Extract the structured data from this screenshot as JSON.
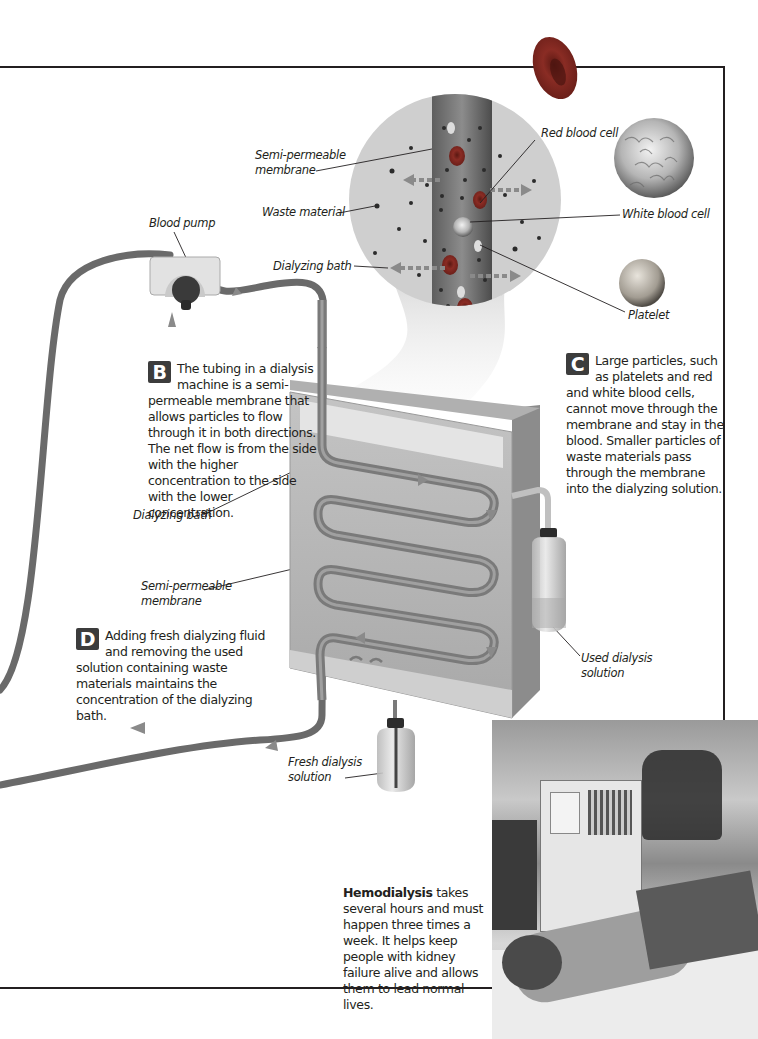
{
  "figure": {
    "callouts": {
      "b": {
        "letter": "B",
        "text": "The tubing in a dialysis machine is a semi-permeable membrane that allows particles to flow through it in both directions. The net flow is from the side with the higher concentration to the side with the lower concentration."
      },
      "c": {
        "letter": "C",
        "text": "Large particles, such as platelets and red and white blood cells, cannot move through the membrane and stay in the blood. Smaller particles of waste materials pass through the membrane into the dialyzing solution."
      },
      "d": {
        "letter": "D",
        "text": "Adding fresh dialyzing fluid and removing the used solution containing waste materials maintains the concentration of the dialyzing bath."
      }
    },
    "labels": {
      "semi_permeable_top_1": "Semi-permeable",
      "semi_permeable_top_2": "membrane",
      "waste_material": "Waste material",
      "dialyzing_bath_top": "Dialyzing bath",
      "blood_pump": "Blood pump",
      "red_blood_cell": "Red blood cell",
      "white_blood_cell": "White blood cell",
      "platelet": "Platelet",
      "dialyzing_bath_left": "Dialyzing bath",
      "semi_permeable_left_1": "Semi-permeable",
      "semi_permeable_left_2": "membrane",
      "used_solution_1": "Used dialysis",
      "used_solution_2": "solution",
      "fresh_solution_1": "Fresh dialysis",
      "fresh_solution_2": "solution"
    },
    "caption": {
      "bold": "Hemodialysis",
      "text": " takes several hours and must happen three times a week. It helps keep people with kidney failure alive and allows them to lead normal lives."
    },
    "photo": {
      "alt": "Patient receiving hemodialysis in a clinic"
    },
    "colors": {
      "rule": "#231f20",
      "badge": "#3c3c3c",
      "bath": "#b4b4b4",
      "tube": "#6e6e6e",
      "circle": "#cfcfcf",
      "red_cell": "#7a2a22"
    }
  }
}
